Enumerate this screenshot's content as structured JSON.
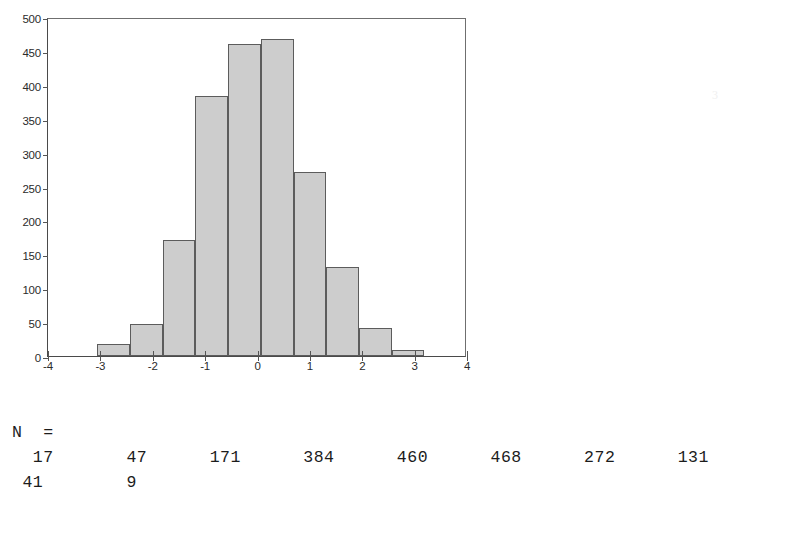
{
  "chart_data": {
    "type": "bar",
    "title": "",
    "subtitle": "",
    "xlabel": "",
    "ylabel": "",
    "xlim": [
      -4,
      4
    ],
    "ylim": [
      0,
      500
    ],
    "grid": false,
    "legend_position": "none",
    "bin_width": 0.625,
    "bin_starts": [
      -3.0625,
      -2.4375,
      -1.8125,
      -1.1875,
      -0.5625,
      0.0625,
      0.6875,
      1.3125,
      1.9375,
      2.5625
    ],
    "categories": [
      "-2.75",
      "-2.12",
      "-1.50",
      "-0.87",
      "-0.25",
      "0.37",
      "1.00",
      "1.62",
      "2.25",
      "2.87"
    ],
    "values": [
      17,
      47,
      171,
      384,
      460,
      468,
      272,
      131,
      41,
      9
    ],
    "x_ticks": [
      "-4",
      "-3",
      "-2",
      "-1",
      "0",
      "1",
      "2",
      "3",
      "4"
    ],
    "x_tick_values": [
      -4,
      -3,
      -2,
      -1,
      0,
      1,
      2,
      3,
      4
    ],
    "y_ticks": [
      "0",
      "50",
      "100",
      "150",
      "200",
      "250",
      "300",
      "350",
      "400",
      "450",
      "500"
    ],
    "y_tick_values": [
      0,
      50,
      100,
      150,
      200,
      250,
      300,
      350,
      400,
      450,
      500
    ],
    "bar_fill_color": "#cdcdcd",
    "bar_edge_color": "#5c5c5c",
    "axis_color": "#4a4a4a"
  },
  "legend": {
    "n_label": "N  =",
    "counts": [
      17,
      47,
      171,
      384,
      460,
      468,
      272,
      131,
      41,
      9
    ],
    "row1": "  17       47      171      384      460      468      272      131",
    "row2": " 41        9"
  },
  "artifact": {
    "glyph": "3"
  }
}
